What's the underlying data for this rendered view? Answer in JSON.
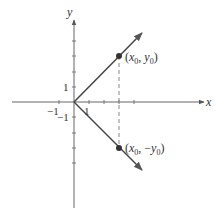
{
  "diagram": {
    "axes": {
      "x_label": "x",
      "y_label": "y",
      "x_tick_pos": "1",
      "x_tick_neg": "−1",
      "y_tick_pos": "1",
      "y_tick_neg": "−1"
    },
    "points": [
      {
        "label_open": "(",
        "var1": "x",
        "sub1": "0",
        "sep": ", ",
        "sign": "",
        "var2": "y",
        "sub2": "0",
        "label_close": ")"
      },
      {
        "label_open": "(",
        "var1": "x",
        "sub1": "0",
        "sep": ", ",
        "sign": "−",
        "var2": "y",
        "sub2": "0",
        "label_close": ")"
      }
    ],
    "colors": {
      "axis": "#555555",
      "ray": "#444444",
      "dashed": "#777777",
      "point": "#333333"
    }
  }
}
